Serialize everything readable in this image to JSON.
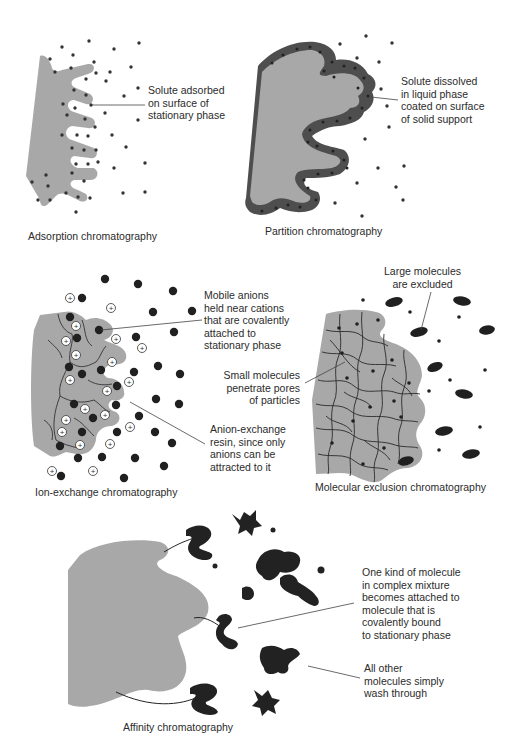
{
  "panels": {
    "adsorption": {
      "caption": "Adsorption chromatography",
      "annotation": "Solute adsorbed\non surface of\nstationary phase"
    },
    "partition": {
      "caption": "Partition chromatography",
      "annotation": "Solute dissolved\nin liquid phase\ncoated on surface\nof solid support"
    },
    "ion_exchange": {
      "caption": "Ion-exchange chromatography",
      "annotation_top": "Mobile anions\nheld near cations\nthat are covalently\nattached to\nstationary phase",
      "annotation_bottom": "Anion-exchange\nresin, since only\nanions can be\nattracted to it"
    },
    "molecular_exclusion": {
      "caption": "Molecular exclusion chromatography",
      "annotation_top": "Large molecules\nare excluded",
      "annotation_left": "Small molecules\npenetrate pores\nof particles"
    },
    "affinity": {
      "caption": "Affinity chromatography",
      "annotation_top": "One kind of molecule\nin complex mixture\nbecomes attached to\nmolecule that is\ncovalently bound\nto stationary phase",
      "annotation_bottom": "All other\nmolecules simply\nwash through"
    }
  },
  "colors": {
    "stationary_phase": "#a9a9a9",
    "liquid_coating": "#555555",
    "solute": "#2a2a2a",
    "background": "#ffffff"
  }
}
